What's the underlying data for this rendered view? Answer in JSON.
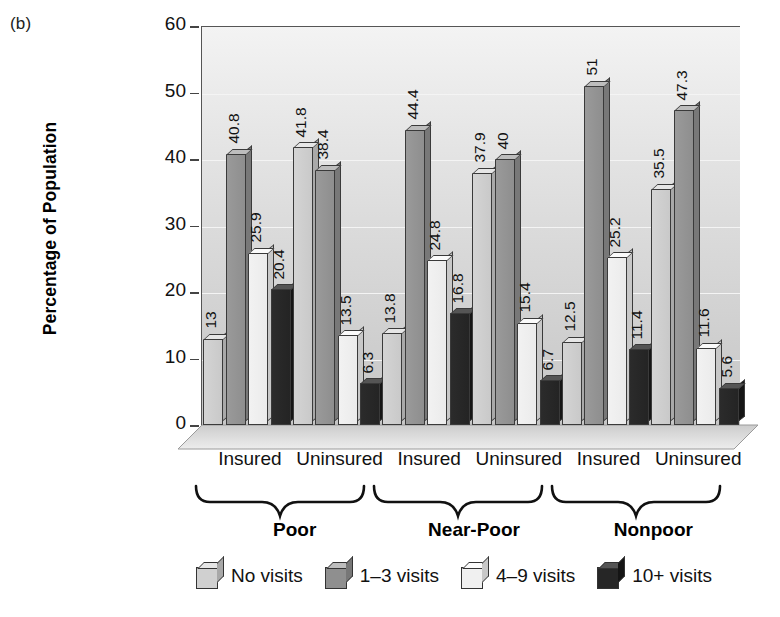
{
  "panel": {
    "label": "(b)"
  },
  "chart_data": {
    "type": "bar",
    "title": "",
    "xlabel": "",
    "ylabel": "Percentage of Population",
    "ylim": [
      0,
      60
    ],
    "yticks": [
      0,
      10,
      20,
      30,
      40,
      50,
      60
    ],
    "grid": true,
    "legend_position": "bottom",
    "categories": [
      "Poor / Insured",
      "Poor / Uninsured",
      "Near-Poor / Insured",
      "Near-Poor / Uninsured",
      "Nonpoor / Insured",
      "Nonpoor / Uninsured"
    ],
    "group_labels": [
      "Poor",
      "Near-Poor",
      "Nonpoor"
    ],
    "subgroup_labels": [
      "Insured",
      "Uninsured",
      "Insured",
      "Uninsured",
      "Insured",
      "Uninsured"
    ],
    "series": [
      {
        "name": "No visits",
        "color": "#cccccc",
        "values": [
          13,
          41.8,
          13.8,
          37.9,
          12.5,
          35.5
        ]
      },
      {
        "name": "1–3 visits",
        "color": "#909090",
        "values": [
          40.8,
          38.4,
          44.4,
          40,
          51,
          47.3
        ]
      },
      {
        "name": "4–9 visits",
        "color": "#f0f0f0",
        "values": [
          25.9,
          13.5,
          24.8,
          15.4,
          25.2,
          11.6
        ]
      },
      {
        "name": "10+ visits",
        "color": "#262626",
        "values": [
          20.4,
          6.3,
          16.8,
          6.7,
          11.4,
          5.6
        ]
      }
    ],
    "value_labels": [
      [
        "13",
        "40.8",
        "25.9",
        "20.4"
      ],
      [
        "41.8",
        "38.4",
        "13.5",
        "6.3"
      ],
      [
        "13.8",
        "44.4",
        "24.8",
        "16.8"
      ],
      [
        "37.9",
        "40",
        "15.4",
        "6.7"
      ],
      [
        "12.5",
        "51",
        "25.2",
        "11.4"
      ],
      [
        "35.5",
        "47.3",
        "11.6",
        "5.6"
      ]
    ]
  },
  "legend": {
    "items": [
      {
        "label": "No visits"
      },
      {
        "label": "1–3 visits"
      },
      {
        "label": "4–9 visits"
      },
      {
        "label": "10+ visits"
      }
    ]
  }
}
